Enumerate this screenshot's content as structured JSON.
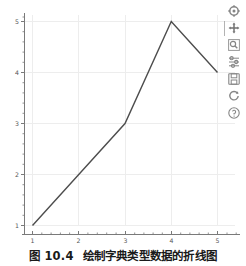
{
  "figure": {
    "background_color": "#ffffff",
    "axes_color": "#7a7a7a",
    "grid_color": "#ededed",
    "line_color": "#4d4d4d",
    "tick_label_color": "#555555"
  },
  "chart_data": {
    "type": "line",
    "title": "",
    "xlabel": "",
    "ylabel": "",
    "x": [
      1,
      2,
      3,
      4,
      5
    ],
    "values": [
      1,
      2,
      3,
      5,
      4
    ],
    "series": [
      {
        "name": "",
        "values": [
          1,
          2,
          3,
          5,
          4
        ]
      }
    ],
    "xlim": [
      0.8,
      5.2
    ],
    "ylim": [
      0.78,
      5.2
    ],
    "xticks": [
      1,
      2,
      3,
      4,
      5
    ],
    "yticks": [
      1,
      2,
      3,
      4,
      5
    ],
    "xtick_labels": [
      "1",
      "2",
      "3",
      "4",
      "5"
    ],
    "ytick_labels": [
      "1",
      "2",
      "3",
      "4",
      "5"
    ],
    "grid": true,
    "grid_axis": "both",
    "legend": false,
    "legend_position": "none",
    "minor_ticks": true
  },
  "toolbar": {
    "items": [
      {
        "name": "home-icon",
        "label": "Home"
      },
      {
        "name": "pan-move-icon",
        "label": "Pan/Move"
      },
      {
        "name": "zoom-rect-icon",
        "label": "Zoom to rectangle"
      },
      {
        "name": "configure-subplots-icon",
        "label": "Configure subplots"
      },
      {
        "name": "save-icon",
        "label": "Save figure"
      },
      {
        "name": "refresh-icon",
        "label": "Refresh"
      },
      {
        "name": "help-icon",
        "label": "Help"
      }
    ]
  },
  "caption": {
    "figure_number": "图 10.4",
    "text": "绘制字典类型数据的折线图"
  }
}
